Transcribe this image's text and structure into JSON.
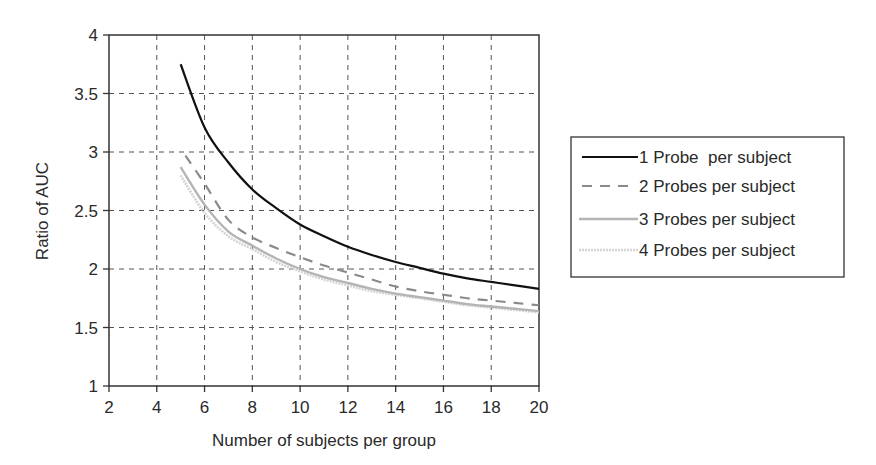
{
  "chart_data": {
    "type": "line",
    "title": "",
    "xlabel": "Number of subjects per group",
    "ylabel": "Ratio of AUC",
    "xlim": [
      2,
      20
    ],
    "ylim": [
      1,
      4
    ],
    "xticks": [
      2,
      4,
      6,
      8,
      10,
      12,
      14,
      16,
      18,
      20
    ],
    "yticks": [
      1,
      1.5,
      2,
      2.5,
      3,
      3.5,
      4
    ],
    "ytick_labels": [
      "1",
      "1.5",
      "2",
      "2.5",
      "3",
      "3.5",
      "4"
    ],
    "grid": true,
    "legend_position": "right",
    "x": [
      5,
      6,
      7,
      8,
      9,
      10,
      11,
      12,
      13,
      14,
      15,
      16,
      17,
      18,
      19,
      20
    ],
    "series": [
      {
        "name": "1 Probe  per subject",
        "style": "solid",
        "color": "#111111",
        "values": [
          3.75,
          3.21,
          2.91,
          2.68,
          2.52,
          2.38,
          2.28,
          2.19,
          2.12,
          2.06,
          2.01,
          1.96,
          1.92,
          1.89,
          1.86,
          1.83
        ]
      },
      {
        "name": "2 Probes per subject",
        "style": "dashed",
        "color": "#8a8a8a",
        "x_start": 5.2,
        "values": [
          2.97,
          2.73,
          2.42,
          2.27,
          2.18,
          2.1,
          2.03,
          1.97,
          1.91,
          1.85,
          1.81,
          1.78,
          1.75,
          1.73,
          1.71,
          1.69
        ]
      },
      {
        "name": "3 Probes per subject",
        "style": "solid",
        "color": "#b4b4b4",
        "values": [
          2.87,
          2.55,
          2.32,
          2.2,
          2.09,
          2.0,
          1.93,
          1.88,
          1.83,
          1.79,
          1.76,
          1.73,
          1.7,
          1.68,
          1.66,
          1.64
        ]
      },
      {
        "name": "4 Probes per subject",
        "style": "dotted",
        "color": "#d4d4d4",
        "values": [
          2.8,
          2.48,
          2.28,
          2.17,
          2.06,
          1.98,
          1.91,
          1.86,
          1.81,
          1.78,
          1.75,
          1.72,
          1.69,
          1.67,
          1.65,
          1.63
        ]
      }
    ]
  }
}
